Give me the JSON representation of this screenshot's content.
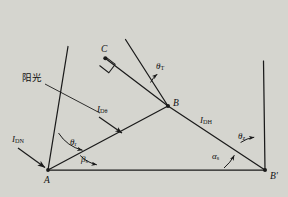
{
  "figure": {
    "type": "geometry-diagram",
    "points": [
      {
        "id": "A",
        "label": "A",
        "x": 48,
        "y": 170
      },
      {
        "id": "B",
        "label": "B",
        "x": 168,
        "y": 106
      },
      {
        "id": "C",
        "label": "C",
        "x": 105,
        "y": 57
      },
      {
        "id": "Bp",
        "label": "B'",
        "x": 265,
        "y": 170
      }
    ],
    "segment_labels": [
      {
        "id": "IDN",
        "base": "I",
        "sub": "DN"
      },
      {
        "id": "IDtheta",
        "base": "I",
        "sub": "Dθ"
      },
      {
        "id": "IDH",
        "base": "I",
        "sub": "DH"
      }
    ],
    "angle_labels": [
      {
        "id": "theta_T",
        "greek": "θ",
        "sub": "T"
      },
      {
        "id": "theta_r",
        "greek": "θ",
        "sub": "r"
      },
      {
        "id": "beta_s",
        "greek": "β",
        "sub": "s"
      },
      {
        "id": "alpha_s",
        "greek": "α",
        "sub": "s"
      },
      {
        "id": "theta_z",
        "greek": "θ",
        "sub": "z"
      }
    ],
    "annotations": [
      {
        "id": "sunlight",
        "text": "阳光"
      }
    ],
    "right_angle_marker": {
      "at": "C",
      "present": true
    },
    "colors": {
      "background": "#d5d5cf",
      "stroke": "#1a1a1a",
      "text": "#111111"
    }
  }
}
